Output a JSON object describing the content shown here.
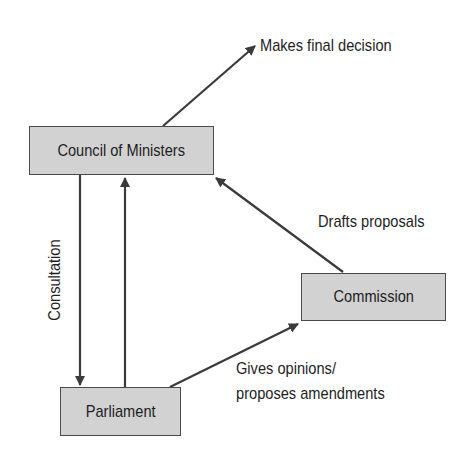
{
  "diagram": {
    "title": "",
    "nodes": [
      {
        "id": "council",
        "label": "Council of Ministers"
      },
      {
        "id": "commission",
        "label": "Commission"
      },
      {
        "id": "parliament",
        "label": "Parliament"
      }
    ],
    "edges": [
      {
        "from": "council",
        "to": "outcome",
        "label": "Makes final decision"
      },
      {
        "from": "council",
        "to": "parliament",
        "label": "Consultation"
      },
      {
        "from": "parliament",
        "to": "council",
        "label": ""
      },
      {
        "from": "commission",
        "to": "council",
        "label": "Drafts proposals"
      },
      {
        "from": "parliament",
        "to": "commission",
        "label": "Gives opinions/ proposes amendments"
      }
    ],
    "labels": {
      "final_decision": "Makes final decision",
      "consultation": "Consultation",
      "drafts_proposals": "Drafts proposals",
      "gives_opinions_line1": "Gives opinions/",
      "gives_opinions_line2": "proposes amendments"
    },
    "colors": {
      "box_fill": "#d2d2d2",
      "box_border": "#4a4a4a",
      "arrow": "#3a3a3a",
      "text": "#1e1e1e"
    }
  }
}
